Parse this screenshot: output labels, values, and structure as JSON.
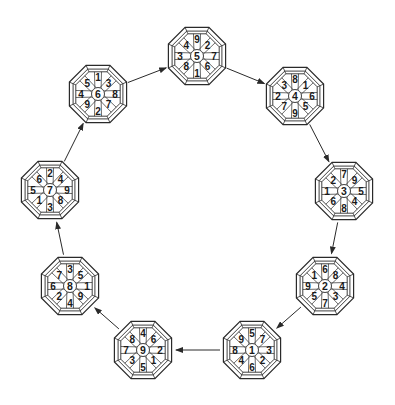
{
  "diagram": {
    "colors": {
      "stroke": "#2a2a2a",
      "text": "#1a1a1a",
      "background": "#ffffff"
    },
    "octagon_radius": 31,
    "slot_order": [
      "top",
      "top_right",
      "right",
      "bottom_right",
      "bottom",
      "bottom_left",
      "left",
      "top_left"
    ],
    "nodes": [
      {
        "id": "n5",
        "cx": 197,
        "cy": 56,
        "center": "5",
        "ring": [
          "9",
          "2",
          "7",
          "6",
          "1",
          "8",
          "3",
          "4"
        ]
      },
      {
        "id": "n4",
        "cx": 295,
        "cy": 96,
        "center": "4",
        "ring": [
          "8",
          "1",
          "6",
          "5",
          "9",
          "7",
          "2",
          "3"
        ]
      },
      {
        "id": "n3",
        "cx": 344,
        "cy": 191,
        "center": "3",
        "ring": [
          "7",
          "9",
          "5",
          "4",
          "8",
          "6",
          "1",
          "2"
        ]
      },
      {
        "id": "n2",
        "cx": 325,
        "cy": 286,
        "center": "2",
        "ring": [
          "6",
          "8",
          "4",
          "3",
          "7",
          "5",
          "9",
          "1"
        ]
      },
      {
        "id": "n1",
        "cx": 252,
        "cy": 350,
        "center": "1",
        "ring": [
          "5",
          "7",
          "3",
          "2",
          "6",
          "4",
          "8",
          "9"
        ]
      },
      {
        "id": "n9",
        "cx": 143,
        "cy": 350,
        "center": "9",
        "ring": [
          "4",
          "6",
          "2",
          "1",
          "5",
          "3",
          "7",
          "8"
        ]
      },
      {
        "id": "n8",
        "cx": 70,
        "cy": 286,
        "center": "8",
        "ring": [
          "3",
          "5",
          "1",
          "9",
          "4",
          "2",
          "6",
          "7"
        ]
      },
      {
        "id": "n7",
        "cx": 50,
        "cy": 190,
        "center": "7",
        "ring": [
          "2",
          "4",
          "9",
          "8",
          "3",
          "1",
          "5",
          "6"
        ]
      },
      {
        "id": "n6",
        "cx": 98,
        "cy": 94,
        "center": "6",
        "ring": [
          "1",
          "3",
          "8",
          "7",
          "2",
          "9",
          "4",
          "5"
        ]
      }
    ],
    "arrows": [
      {
        "from": "n6",
        "to": "n5"
      },
      {
        "from": "n5",
        "to": "n4"
      },
      {
        "from": "n4",
        "to": "n3"
      },
      {
        "from": "n3",
        "to": "n2"
      },
      {
        "from": "n2",
        "to": "n1"
      },
      {
        "from": "n1",
        "to": "n9"
      },
      {
        "from": "n9",
        "to": "n8"
      },
      {
        "from": "n8",
        "to": "n7"
      },
      {
        "from": "n7",
        "to": "n6"
      }
    ]
  }
}
